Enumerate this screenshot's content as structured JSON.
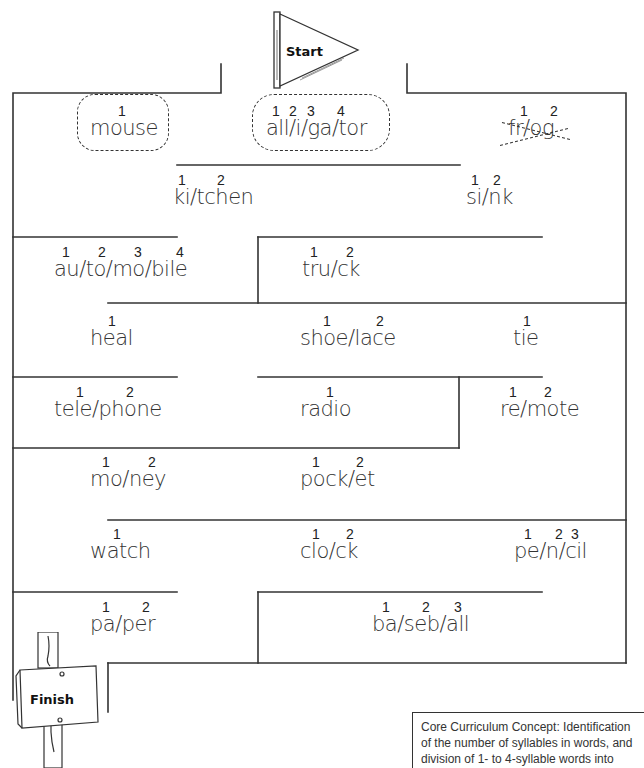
{
  "start_flag": {
    "label": "Start"
  },
  "finish_sign": {
    "label": "Finish"
  },
  "words": [
    {
      "id": "mouse",
      "text": "mouse",
      "numbers": [
        "1"
      ],
      "circled": true,
      "crossed": false
    },
    {
      "id": "alligator",
      "text": "all/i/ga/tor",
      "numbers": [
        "1",
        "2",
        "3",
        "4"
      ],
      "circled": true,
      "crossed": false
    },
    {
      "id": "frog",
      "text": "fr/og",
      "numbers": [
        "1",
        "2"
      ],
      "circled": false,
      "crossed": true
    },
    {
      "id": "kitchen",
      "text": "ki/tchen",
      "numbers": [
        "1",
        "2"
      ],
      "circled": false,
      "crossed": false
    },
    {
      "id": "sink",
      "text": "si/nk",
      "numbers": [
        "1",
        "2"
      ],
      "circled": false,
      "crossed": false
    },
    {
      "id": "automobile",
      "text": "au/to/mo/bile",
      "numbers": [
        "1",
        "2",
        "3",
        "4"
      ],
      "circled": false,
      "crossed": false
    },
    {
      "id": "truck",
      "text": "tru/ck",
      "numbers": [
        "1",
        "2"
      ],
      "circled": false,
      "crossed": false
    },
    {
      "id": "heal",
      "text": "heal",
      "numbers": [
        "1"
      ],
      "circled": false,
      "crossed": false
    },
    {
      "id": "shoelace",
      "text": "shoe/lace",
      "numbers": [
        "1",
        "2"
      ],
      "circled": false,
      "crossed": false
    },
    {
      "id": "tie",
      "text": "tie",
      "numbers": [
        "1"
      ],
      "circled": false,
      "crossed": false
    },
    {
      "id": "telephone",
      "text": "tele/phone",
      "numbers": [
        "1",
        "2"
      ],
      "circled": false,
      "crossed": false
    },
    {
      "id": "radio",
      "text": "radio",
      "numbers": [
        "1"
      ],
      "circled": false,
      "crossed": false
    },
    {
      "id": "remote",
      "text": "re/mote",
      "numbers": [
        "1",
        "2"
      ],
      "circled": false,
      "crossed": false
    },
    {
      "id": "money",
      "text": "mo/ney",
      "numbers": [
        "1",
        "2"
      ],
      "circled": false,
      "crossed": false
    },
    {
      "id": "pocket",
      "text": "pock/et",
      "numbers": [
        "1",
        "2"
      ],
      "circled": false,
      "crossed": false
    },
    {
      "id": "watch",
      "text": "watch",
      "numbers": [
        "1"
      ],
      "circled": false,
      "crossed": false
    },
    {
      "id": "clock",
      "text": "clo/ck",
      "numbers": [
        "1",
        "2"
      ],
      "circled": false,
      "crossed": false
    },
    {
      "id": "pencil",
      "text": "pe/n/cil",
      "numbers": [
        "1",
        "2",
        "3"
      ],
      "circled": false,
      "crossed": false
    },
    {
      "id": "paper",
      "text": "pa/per",
      "numbers": [
        "1",
        "2"
      ],
      "circled": false,
      "crossed": false
    },
    {
      "id": "baseball",
      "text": "ba/seb/all",
      "numbers": [
        "1",
        "2",
        "3"
      ],
      "circled": false,
      "crossed": false
    }
  ],
  "concept_note": "Core Curriculum Concept: Identification of the number of syllables in words, and division of 1- to 4-syllable words into syllable parts.",
  "colors": {
    "line": "#333333",
    "text": "#333333",
    "background": "#ffffff"
  }
}
